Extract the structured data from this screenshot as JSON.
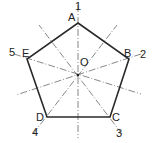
{
  "diagram": {
    "title": "",
    "colors": {
      "background": "#ffffff",
      "outline": "#2a2a2a",
      "axis": "#555555"
    },
    "center": {
      "label": "O",
      "x": 78,
      "y": 75
    },
    "vertices": [
      {
        "label": "A",
        "number": "1",
        "x": 78,
        "y": 23
      },
      {
        "label": "B",
        "number": "2",
        "x": 129,
        "y": 59
      },
      {
        "label": "C",
        "number": "3",
        "x": 110,
        "y": 117
      },
      {
        "label": "D",
        "number": "4",
        "x": 47,
        "y": 117
      },
      {
        "label": "E",
        "number": "5",
        "x": 27,
        "y": 59
      }
    ],
    "axes": [
      {
        "name": "axis-1",
        "from": [
          78,
          5
        ],
        "to": [
          78,
          138
        ]
      },
      {
        "name": "axis-2",
        "from": [
          141,
          54
        ],
        "to": [
          16,
          95
        ]
      },
      {
        "name": "axis-3",
        "from": [
          122,
          134
        ],
        "to": [
          39,
          25
        ]
      },
      {
        "name": "axis-4",
        "from": [
          33,
          134
        ],
        "to": [
          117,
          25
        ]
      },
      {
        "name": "axis-5",
        "from": [
          14,
          54
        ],
        "to": [
          141,
          94
        ]
      }
    ]
  }
}
